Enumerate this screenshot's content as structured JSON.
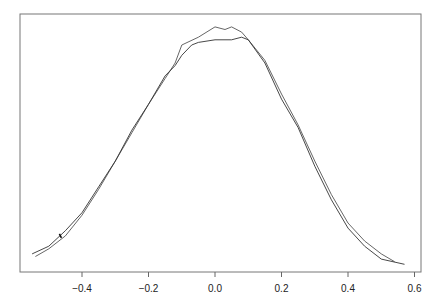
{
  "chart_data": {
    "type": "line",
    "title": "",
    "xlabel": "",
    "ylabel": "",
    "xlim": [
      -0.59,
      0.62
    ],
    "ylim": [
      0,
      1
    ],
    "grid": false,
    "legend": null,
    "x_ticks": [
      -0.4,
      -0.2,
      0.0,
      0.2,
      0.4,
      0.6
    ],
    "x_tick_labels": [
      "-0.4",
      "-0.2",
      "0.0",
      "0.2",
      "0.4",
      "0.6"
    ],
    "y_ticks": [],
    "series": [
      {
        "name": "curve-1",
        "color": "#555555",
        "x": [
          -0.54,
          -0.5,
          -0.45,
          -0.4,
          -0.35,
          -0.3,
          -0.25,
          -0.2,
          -0.15,
          -0.12,
          -0.1,
          -0.05,
          0.0,
          0.03,
          0.05,
          0.08,
          0.1,
          0.15,
          0.2,
          0.25,
          0.3,
          0.35,
          0.4,
          0.45,
          0.5,
          0.54
        ],
        "y": [
          0.06,
          0.09,
          0.14,
          0.22,
          0.32,
          0.43,
          0.54,
          0.65,
          0.75,
          0.81,
          0.88,
          0.91,
          0.95,
          0.94,
          0.95,
          0.93,
          0.9,
          0.82,
          0.69,
          0.57,
          0.43,
          0.3,
          0.19,
          0.12,
          0.07,
          0.04
        ]
      },
      {
        "name": "curve-2",
        "color": "#333333",
        "x": [
          -0.55,
          -0.5,
          -0.45,
          -0.4,
          -0.35,
          -0.3,
          -0.25,
          -0.2,
          -0.15,
          -0.12,
          -0.1,
          -0.07,
          -0.05,
          0.0,
          0.05,
          0.08,
          0.1,
          0.15,
          0.2,
          0.25,
          0.3,
          0.35,
          0.4,
          0.45,
          0.5,
          0.57
        ],
        "y": [
          0.07,
          0.1,
          0.16,
          0.23,
          0.33,
          0.43,
          0.55,
          0.65,
          0.76,
          0.8,
          0.84,
          0.88,
          0.89,
          0.9,
          0.9,
          0.91,
          0.9,
          0.81,
          0.67,
          0.56,
          0.41,
          0.28,
          0.17,
          0.1,
          0.05,
          0.03
        ]
      }
    ],
    "annotations": [
      {
        "type": "mark",
        "x": -0.465,
        "y": 0.14
      }
    ]
  }
}
